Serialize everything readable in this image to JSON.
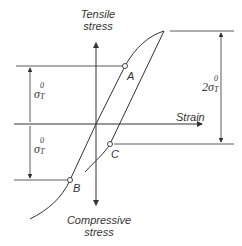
{
  "diagram": {
    "type": "stress-strain hysteresis (Bauschinger effect)",
    "axes": {
      "y_top_label_line1": "Tensile",
      "y_top_label_line2": "stress",
      "y_bottom_label_line1": "Compressive",
      "y_bottom_label_line2": "stress",
      "x_label": "Strain"
    },
    "points": [
      {
        "id": "A",
        "label": "A"
      },
      {
        "id": "B",
        "label": "B"
      },
      {
        "id": "C",
        "label": "C"
      }
    ],
    "dimensions": {
      "upper_left": {
        "symbol": "σ",
        "sup": "0",
        "sub": "T"
      },
      "lower_left": {
        "symbol": "σ",
        "sup": "0",
        "sub": "T"
      },
      "right": {
        "prefix": "2",
        "symbol": "σ",
        "sup": "0",
        "sub": "T"
      }
    },
    "colors": {
      "line": "#333333",
      "background": "#ffffff"
    }
  }
}
